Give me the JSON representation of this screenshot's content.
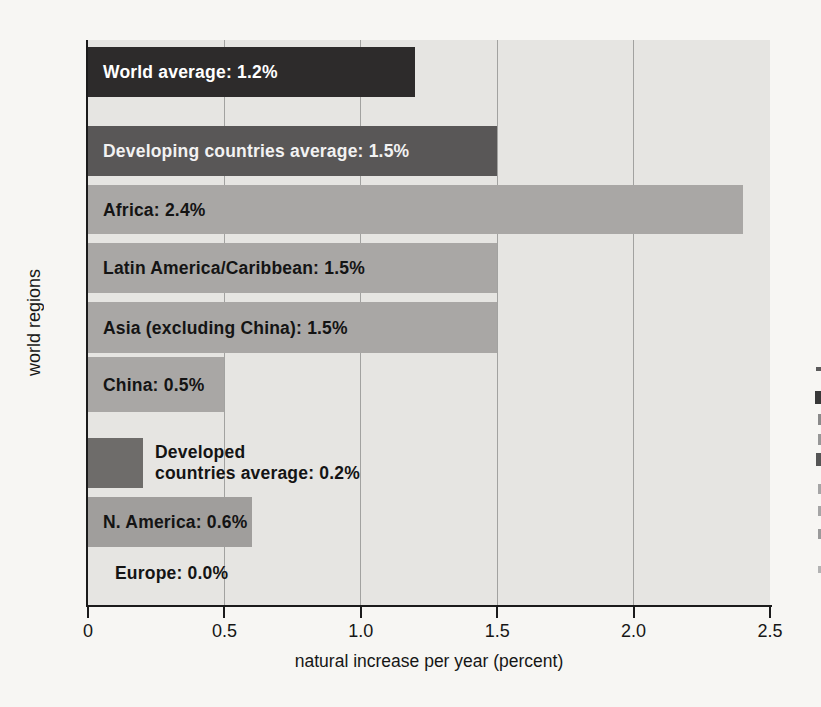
{
  "chart_data": {
    "type": "bar",
    "orientation": "horizontal",
    "title": "",
    "xlabel": "natural increase per year (percent)",
    "ylabel": "world regions",
    "xlim": [
      0,
      2.5
    ],
    "xtick_values": [
      0,
      0.5,
      1.0,
      1.5,
      2.0,
      2.5
    ],
    "xtick_labels": [
      "0",
      "0.5",
      "1.0",
      "1.5",
      "2.0",
      "2.5"
    ],
    "gridlines_x": [
      0.5,
      1.0,
      1.5,
      2.0
    ],
    "plot_background": "#e6e5e2",
    "bars": [
      {
        "region": "World average",
        "value": 1.2,
        "label": "World average: 1.2%",
        "bar_color": "#2d2b2b",
        "label_color": "#ffffff",
        "label_placement": "inside"
      },
      {
        "region": "Developing countries average",
        "value": 1.5,
        "label": "Developing countries average: 1.5%",
        "bar_color": "#595757",
        "label_color": "#f2f2f2",
        "label_placement": "inside"
      },
      {
        "region": "Africa",
        "value": 2.4,
        "label": "Africa: 2.4%",
        "bar_color": "#a9a7a5",
        "label_color": "#141414",
        "label_placement": "inside"
      },
      {
        "region": "Latin America/Caribbean",
        "value": 1.5,
        "label": "Latin America/Caribbean: 1.5%",
        "bar_color": "#a9a7a5",
        "label_color": "#141414",
        "label_placement": "inside"
      },
      {
        "region": "Asia (excluding China)",
        "value": 1.5,
        "label": "Asia (excluding China): 1.5%",
        "bar_color": "#a9a7a5",
        "label_color": "#141414",
        "label_placement": "inside"
      },
      {
        "region": "China",
        "value": 0.5,
        "label": "China: 0.5%",
        "bar_color": "#a9a7a5",
        "label_color": "#141414",
        "label_placement": "inside"
      },
      {
        "region": "Developed countries average",
        "value": 0.2,
        "label": "Developed countries average: 0.2%",
        "label_lines": [
          "Developed",
          "countries average: 0.2%"
        ],
        "bar_color": "#6e6c6a",
        "label_color": "#141414",
        "label_placement": "right-of-bar"
      },
      {
        "region": "N. America",
        "value": 0.6,
        "label": "N. America: 0.6%",
        "bar_color": "#a09e9c",
        "label_color": "#141414",
        "label_placement": "inside"
      },
      {
        "region": "Europe",
        "value": 0.0,
        "label": "Europe: 0.0%",
        "bar_color": null,
        "label_color": "#141414",
        "label_placement": "no-bar"
      }
    ]
  }
}
